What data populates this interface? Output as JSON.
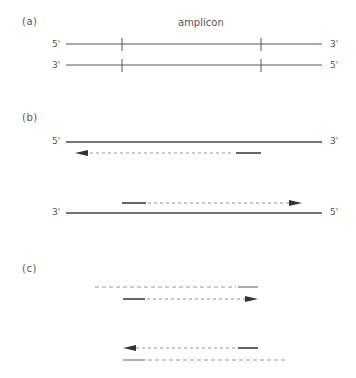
{
  "panels": {
    "a": {
      "label": "(a)",
      "title": "amplicon",
      "strand_top": {
        "left": "5'",
        "right": "3'"
      },
      "strand_bottom": {
        "left": "3'",
        "right": "5'"
      }
    },
    "b": {
      "label": "(b)",
      "strand_top": {
        "left": "5'",
        "right": "3'"
      },
      "strand_bottom": {
        "left": "3'",
        "right": "5'"
      }
    },
    "c": {
      "label": "(c)"
    }
  },
  "colors": {
    "strand": "#555555",
    "primer": "#333333",
    "dashed": "#777777"
  }
}
